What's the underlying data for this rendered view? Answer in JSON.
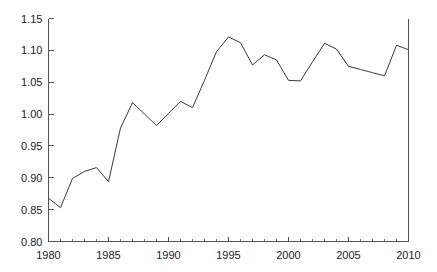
{
  "chart_data": {
    "type": "line",
    "title": "",
    "subtitle": "",
    "xlabel": "",
    "ylabel": "",
    "xlim": [
      1980,
      2010
    ],
    "ylim": [
      0.8,
      1.15
    ],
    "grid": false,
    "legend": null,
    "legend_position": "none",
    "x_major_ticks": [
      1980,
      1985,
      1990,
      1995,
      2000,
      2005,
      2010
    ],
    "x_major_tick_labels": [
      "1980",
      "1985",
      "1990",
      "1995",
      "2000",
      "2005",
      "2010"
    ],
    "x_minor_tick_interval": 1,
    "y_major_ticks": [
      0.8,
      0.85,
      0.9,
      0.95,
      1.0,
      1.05,
      1.1,
      1.15
    ],
    "y_major_tick_labels": [
      "0.80",
      "0.85",
      "0.90",
      "0.95",
      "1.00",
      "1.05",
      "1.10",
      "1.15"
    ],
    "line_color": "#3a3a3a",
    "axis_color": "#555555",
    "background_color": "#ffffff",
    "x": [
      1980,
      1981,
      1982,
      1983,
      1984,
      1985,
      1986,
      1987,
      1988,
      1989,
      1990,
      1991,
      1992,
      1993,
      1994,
      1995,
      1996,
      1997,
      1998,
      1999,
      2000,
      2001,
      2002,
      2003,
      2004,
      2005,
      2006,
      2007,
      2008,
      2009,
      2010
    ],
    "values": [
      0.868,
      0.853,
      0.899,
      0.91,
      0.916,
      0.894,
      0.978,
      1.018,
      1.0,
      0.982,
      1.001,
      1.02,
      1.01,
      1.053,
      1.098,
      1.121,
      1.112,
      1.077,
      1.093,
      1.085,
      1.053,
      1.052,
      1.082,
      1.111,
      1.102,
      1.075,
      1.07,
      1.065,
      1.06,
      1.108,
      1.101
    ],
    "series": [
      {
        "name": "index",
        "values": [
          0.868,
          0.853,
          0.899,
          0.91,
          0.916,
          0.894,
          0.978,
          1.018,
          1.0,
          0.982,
          1.001,
          1.02,
          1.01,
          1.053,
          1.098,
          1.121,
          1.112,
          1.077,
          1.093,
          1.085,
          1.053,
          1.052,
          1.082,
          1.111,
          1.102,
          1.075,
          1.07,
          1.065,
          1.06,
          1.108,
          1.101
        ]
      }
    ]
  }
}
